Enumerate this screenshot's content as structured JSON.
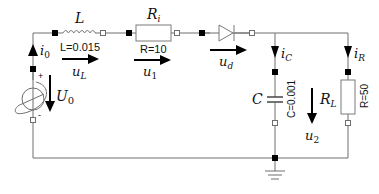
{
  "diagram": {
    "type": "electrical-circuit",
    "components": {
      "source": {
        "symbol": "U",
        "sub": "0",
        "plus": "+",
        "minus": "-"
      },
      "inductor": {
        "symbol": "L",
        "param": "L=0.015"
      },
      "resistor_i": {
        "symbol": "R",
        "sub": "i",
        "param": "R=10"
      },
      "diode": {
        "symbol": "diode"
      },
      "capacitor": {
        "symbol": "C",
        "param": "C=0.001"
      },
      "resistor_l": {
        "symbol": "R",
        "sub": "L",
        "param": "R=50"
      },
      "ground": {
        "symbol": "ground"
      }
    },
    "currents": {
      "i0": {
        "sym": "i",
        "sub": "0"
      },
      "iC": {
        "sym": "i",
        "sub": "C"
      },
      "iR": {
        "sym": "i",
        "sub": "R"
      }
    },
    "voltages": {
      "uL": {
        "sym": "u",
        "sub": "L"
      },
      "u1": {
        "sym": "u",
        "sub": "1"
      },
      "ud": {
        "sym": "u",
        "sub": "d"
      },
      "u2": {
        "sym": "u",
        "sub": "2"
      },
      "U0": {
        "sym": "U",
        "sub": "0"
      }
    }
  }
}
